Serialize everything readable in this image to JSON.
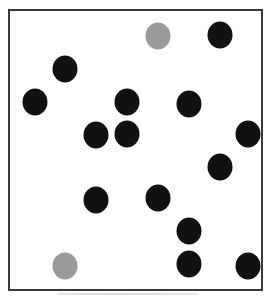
{
  "board": {
    "colors": {
      "black": "#111111",
      "gray": "#9a9a9a",
      "border": "#3a3a3a",
      "background": "#ffffff"
    },
    "grid": {
      "columns": 8,
      "rows": 8
    },
    "dots": [
      {
        "col": 4.7,
        "row": 0.8,
        "color": "gray"
      },
      {
        "col": 6.7,
        "row": 0.75,
        "color": "black"
      },
      {
        "col": 1.7,
        "row": 1.9,
        "color": "black"
      },
      {
        "col": 0.75,
        "row": 3.0,
        "color": "black"
      },
      {
        "col": 3.7,
        "row": 3.0,
        "color": "black"
      },
      {
        "col": 5.7,
        "row": 3.05,
        "color": "black"
      },
      {
        "col": 2.7,
        "row": 4.1,
        "color": "black"
      },
      {
        "col": 3.7,
        "row": 4.05,
        "color": "black"
      },
      {
        "col": 7.6,
        "row": 4.05,
        "color": "black"
      },
      {
        "col": 6.7,
        "row": 5.15,
        "color": "black"
      },
      {
        "col": 2.7,
        "row": 6.25,
        "color": "black"
      },
      {
        "col": 4.7,
        "row": 6.2,
        "color": "black"
      },
      {
        "col": 5.7,
        "row": 7.3,
        "color": "black"
      },
      {
        "col": 1.7,
        "row": 8.45,
        "color": "gray"
      },
      {
        "col": 5.7,
        "row": 8.4,
        "color": "black"
      },
      {
        "col": 7.6,
        "row": 8.45,
        "color": "black"
      }
    ]
  }
}
